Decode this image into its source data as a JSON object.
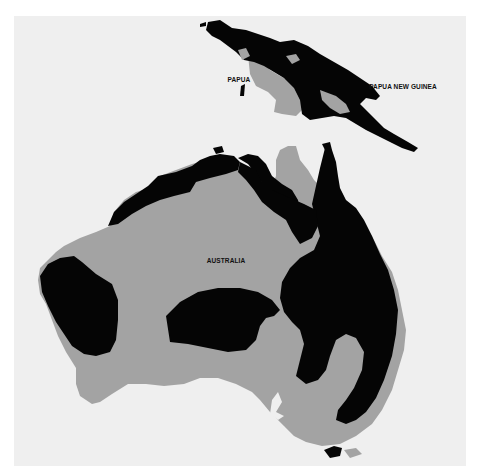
{
  "map": {
    "colors": {
      "page_background": "#ffffff",
      "sea": "#efefef",
      "land_light": "#a3a3a3",
      "land_dark": "#050505",
      "label": "#111111"
    },
    "labels": [
      {
        "id": "papua",
        "text": "PAPUA",
        "x": 239,
        "y": 79
      },
      {
        "id": "papua-new-guinea",
        "text": "PAPUA NEW GUINEA",
        "x": 403,
        "y": 86
      },
      {
        "id": "australia",
        "text": "AUSTRALIA",
        "x": 226,
        "y": 260
      }
    ],
    "regions": {
      "legend": {
        "land_light": "gray region",
        "land_dark": "black region"
      }
    }
  }
}
